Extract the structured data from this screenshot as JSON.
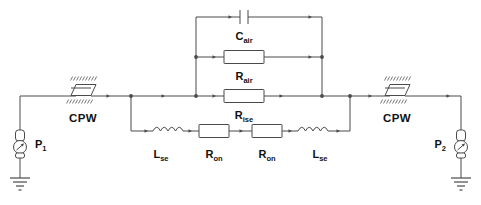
{
  "diagram": {
    "type": "electrical-schematic",
    "colors": {
      "wire": "#4a4a4a",
      "label": "#111111",
      "background": "#ffffff",
      "hatch": "#6a6a6a"
    }
  },
  "ports": [
    {
      "id": "p1",
      "base": "P",
      "sub": "1",
      "symbol": "ac-source",
      "ground": true
    },
    {
      "id": "p2",
      "base": "P",
      "sub": "2",
      "symbol": "ac-source",
      "ground": true
    }
  ],
  "transmission_lines": [
    {
      "id": "cpw-left",
      "label": "CPW",
      "symbol": "cpw-block"
    },
    {
      "id": "cpw-right",
      "label": "CPW",
      "symbol": "cpw-block"
    }
  ],
  "components": [
    {
      "id": "c-air",
      "base": "C",
      "sub": "air",
      "kind": "capacitor",
      "branch": "top"
    },
    {
      "id": "r-air",
      "base": "R",
      "sub": "air",
      "kind": "resistor",
      "branch": "middle"
    },
    {
      "id": "r-ise",
      "base": "R",
      "sub": "ise",
      "kind": "resistor",
      "branch": "main"
    },
    {
      "id": "l-se-left",
      "base": "L",
      "sub": "se",
      "kind": "inductor",
      "branch": "bottom"
    },
    {
      "id": "r-on-left",
      "base": "R",
      "sub": "on",
      "kind": "resistor",
      "branch": "bottom"
    },
    {
      "id": "r-on-right",
      "base": "R",
      "sub": "on",
      "kind": "resistor",
      "branch": "bottom"
    },
    {
      "id": "l-se-right",
      "base": "L",
      "sub": "se",
      "kind": "inductor",
      "branch": "bottom"
    }
  ],
  "labels": {
    "c_air": {
      "base": "C",
      "sub": "air"
    },
    "r_air": {
      "base": "R",
      "sub": "air"
    },
    "r_ise": {
      "base": "R",
      "sub": "ise"
    },
    "l_se_left": {
      "base": "L",
      "sub": "se"
    },
    "r_on_left": {
      "base": "R",
      "sub": "on"
    },
    "r_on_right": {
      "base": "R",
      "sub": "on"
    },
    "l_se_right": {
      "base": "L",
      "sub": "se"
    },
    "cpw_left": "CPW",
    "cpw_right": "CPW",
    "p1": {
      "base": "P",
      "sub": "1"
    },
    "p2": {
      "base": "P",
      "sub": "2"
    }
  }
}
